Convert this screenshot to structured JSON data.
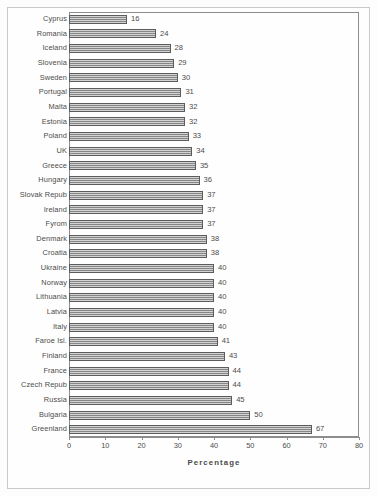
{
  "chart_data": {
    "type": "bar",
    "orientation": "horizontal",
    "title": "",
    "xlabel": "Percentage",
    "ylabel": "",
    "xlim": [
      0,
      80
    ],
    "xticks": [
      0,
      10,
      20,
      30,
      40,
      50,
      60,
      70,
      80
    ],
    "grid": false,
    "legend": null,
    "bar_fill": "#9d9d9d",
    "bar_edge": "#5c5c5c",
    "show_value_labels": true,
    "categories": [
      "Cyprus",
      "Romania",
      "Iceland",
      "Slovenia",
      "Sweden",
      "Portugal",
      "Malta",
      "Estonia",
      "Poland",
      "UK",
      "Greece",
      "Hungary",
      "Slovak Repub",
      "Ireland",
      "Fyrom",
      "Denmark",
      "Croatia",
      "Ukraine",
      "Norway",
      "Lithuania",
      "Latvia",
      "Italy",
      "Faroe Isl.",
      "Finland",
      "France",
      "Czech Repub",
      "Russia",
      "Bulgaria",
      "Greenland"
    ],
    "values": [
      16,
      24,
      28,
      29,
      30,
      31,
      32,
      32,
      33,
      34,
      35,
      36,
      37,
      37,
      37,
      38,
      38,
      40,
      40,
      40,
      40,
      40,
      41,
      43,
      44,
      44,
      45,
      50,
      67
    ],
    "value_labels": [
      "16",
      "24",
      "28",
      "29",
      "30",
      "31",
      "32",
      "32",
      "33",
      "34",
      "35",
      "36",
      "37",
      "37",
      "37",
      "38",
      "38",
      "40",
      "40",
      "40",
      "40",
      "40",
      "41",
      "43",
      "44",
      "44",
      "45",
      "50",
      "67"
    ]
  }
}
